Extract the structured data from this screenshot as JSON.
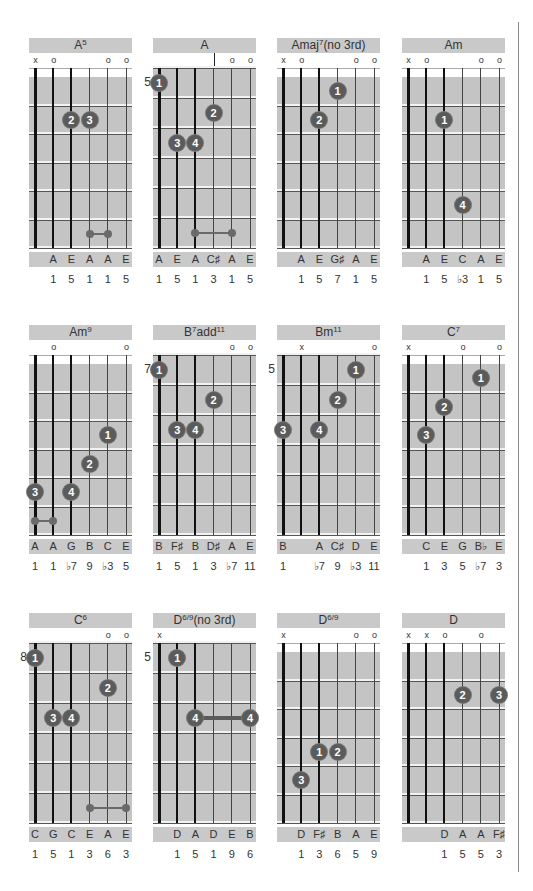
{
  "layout": {
    "columns_x": [
      29,
      153,
      277,
      402
    ],
    "rows_y": [
      38,
      325,
      613
    ]
  },
  "chords": [
    {
      "name": "A",
      "sup": "5",
      "suffix": "",
      "markers": [
        "x",
        "o",
        "",
        "",
        "o",
        "o"
      ],
      "fret_label": "",
      "open": true,
      "dots": [
        {
          "string": 3,
          "fret": 2,
          "label": "2"
        },
        {
          "string": 4,
          "fret": 2,
          "label": "3"
        }
      ],
      "barres": [
        {
          "type": "mini",
          "from": 4,
          "to": 5,
          "fret": 6
        }
      ],
      "notes": [
        "",
        "A",
        "E",
        "A",
        "A",
        "E"
      ],
      "intervals": [
        "",
        "1",
        "5",
        "1",
        "1",
        "5"
      ]
    },
    {
      "name": "A",
      "sup": "",
      "suffix": "",
      "markers": [
        "",
        "",
        "",
        "|",
        "o",
        "o"
      ],
      "fret_label": "5",
      "open": false,
      "dots": [
        {
          "string": 1,
          "fret": 1,
          "label": "1"
        },
        {
          "string": 4,
          "fret": 2,
          "label": "2"
        },
        {
          "string": 2,
          "fret": 3,
          "label": "3"
        },
        {
          "string": 3,
          "fret": 3,
          "label": "4"
        }
      ],
      "barres": [
        {
          "type": "mini",
          "from": 3,
          "to": 5,
          "fret": 6
        }
      ],
      "notes": [
        "A",
        "E",
        "A",
        "C♯",
        "A",
        "E"
      ],
      "intervals": [
        "1",
        "5",
        "1",
        "3",
        "1",
        "5"
      ]
    },
    {
      "name": "Amaj",
      "sup": "7",
      "suffix": "(no 3rd)",
      "markers": [
        "x",
        "o",
        "",
        "",
        "o",
        "o"
      ],
      "fret_label": "",
      "open": true,
      "dots": [
        {
          "string": 4,
          "fret": 1,
          "label": "1"
        },
        {
          "string": 3,
          "fret": 2,
          "label": "2"
        }
      ],
      "barres": [],
      "notes": [
        "",
        "A",
        "E",
        "G♯",
        "A",
        "E"
      ],
      "intervals": [
        "",
        "1",
        "5",
        "7",
        "1",
        "5"
      ]
    },
    {
      "name": "Am",
      "sup": "",
      "suffix": "",
      "markers": [
        "x",
        "o",
        "",
        "",
        "o",
        "o"
      ],
      "fret_label": "",
      "open": true,
      "dots": [
        {
          "string": 3,
          "fret": 2,
          "label": "1"
        },
        {
          "string": 4,
          "fret": 5,
          "label": "4"
        }
      ],
      "barres": [],
      "notes": [
        "",
        "A",
        "E",
        "C",
        "A",
        "E"
      ],
      "intervals": [
        "",
        "1",
        "5",
        "♭3",
        "1",
        "5"
      ]
    },
    {
      "name": "Am",
      "sup": "9",
      "suffix": "",
      "markers": [
        "",
        "o",
        "",
        "",
        "",
        "o"
      ],
      "fret_label": "",
      "open": true,
      "dots": [
        {
          "string": 5,
          "fret": 3,
          "label": "1"
        },
        {
          "string": 4,
          "fret": 4,
          "label": "2"
        },
        {
          "string": 1,
          "fret": 5,
          "label": "3"
        },
        {
          "string": 3,
          "fret": 5,
          "label": "4"
        }
      ],
      "barres": [
        {
          "type": "mini",
          "from": 1,
          "to": 2,
          "fret": 6
        }
      ],
      "notes": [
        "A",
        "A",
        "G",
        "B",
        "C",
        "E"
      ],
      "intervals": [
        "1",
        "1",
        "♭7",
        "9",
        "♭3",
        "5"
      ]
    },
    {
      "name": "B",
      "sup": "7",
      "suffix": "add",
      "sup2": "11",
      "markers": [
        "",
        "",
        "",
        "",
        "o",
        "o"
      ],
      "fret_label": "7",
      "open": false,
      "dots": [
        {
          "string": 1,
          "fret": 1,
          "label": "1"
        },
        {
          "string": 4,
          "fret": 2,
          "label": "2"
        },
        {
          "string": 2,
          "fret": 3,
          "label": "3"
        },
        {
          "string": 3,
          "fret": 3,
          "label": "4"
        }
      ],
      "barres": [],
      "notes": [
        "B",
        "F♯",
        "B",
        "D♯",
        "A",
        "E"
      ],
      "intervals": [
        "1",
        "5",
        "1",
        "3",
        "♭7",
        "11"
      ]
    },
    {
      "name": "Bm",
      "sup": "11",
      "suffix": "",
      "markers": [
        "",
        "x",
        "",
        "",
        "",
        "o"
      ],
      "fret_label": "5",
      "open": false,
      "dots": [
        {
          "string": 5,
          "fret": 1,
          "label": "1"
        },
        {
          "string": 4,
          "fret": 2,
          "label": "2"
        },
        {
          "string": 1,
          "fret": 3,
          "label": "3"
        },
        {
          "string": 3,
          "fret": 3,
          "label": "4"
        }
      ],
      "barres": [],
      "notes": [
        "B",
        "",
        "A",
        "C♯",
        "D",
        "E"
      ],
      "intervals": [
        "1",
        "",
        "♭7",
        "9",
        "♭3",
        "11"
      ]
    },
    {
      "name": "C",
      "sup": "7",
      "suffix": "",
      "markers": [
        "x",
        "",
        "",
        "o",
        "",
        "o"
      ],
      "fret_label": "",
      "open": true,
      "dots": [
        {
          "string": 5,
          "fret": 1,
          "label": "1"
        },
        {
          "string": 3,
          "fret": 2,
          "label": "2"
        },
        {
          "string": 2,
          "fret": 3,
          "label": "3"
        }
      ],
      "barres": [],
      "notes": [
        "",
        "C",
        "E",
        "G",
        "B♭",
        "E"
      ],
      "intervals": [
        "",
        "1",
        "3",
        "5",
        "♭7",
        "3"
      ]
    },
    {
      "name": "C",
      "sup": "6",
      "suffix": "",
      "markers": [
        "",
        "",
        "",
        "",
        "o",
        "o"
      ],
      "fret_label": "8",
      "open": false,
      "dots": [
        {
          "string": 1,
          "fret": 1,
          "label": "1"
        },
        {
          "string": 5,
          "fret": 2,
          "label": "2"
        },
        {
          "string": 2,
          "fret": 3,
          "label": "3"
        },
        {
          "string": 3,
          "fret": 3,
          "label": "4"
        }
      ],
      "barres": [
        {
          "type": "mini",
          "from": 4,
          "to": 6,
          "fret": 6
        }
      ],
      "notes": [
        "C",
        "G",
        "C",
        "E",
        "A",
        "E"
      ],
      "intervals": [
        "1",
        "5",
        "1",
        "3",
        "6",
        "3"
      ]
    },
    {
      "name": "D",
      "sup": "6/9",
      "suffix": "(no 3rd)",
      "markers": [
        "x",
        "",
        "",
        "",
        "",
        ""
      ],
      "fret_label": "5",
      "open": false,
      "dots": [
        {
          "string": 2,
          "fret": 1,
          "label": "1"
        },
        {
          "string": 3,
          "fret": 3,
          "label": "4"
        },
        {
          "string": 6,
          "fret": 3,
          "label": "4"
        }
      ],
      "barres": [
        {
          "type": "thick",
          "from": 3,
          "to": 6,
          "fret": 3
        }
      ],
      "notes": [
        "",
        "D",
        "A",
        "D",
        "E",
        "B"
      ],
      "intervals": [
        "",
        "1",
        "5",
        "1",
        "9",
        "6"
      ]
    },
    {
      "name": "D",
      "sup": "6/9",
      "suffix": "",
      "markers": [
        "x",
        "",
        "",
        "",
        "o",
        "o"
      ],
      "fret_label": "",
      "open": true,
      "dots": [
        {
          "string": 3,
          "fret": 4,
          "label": "1"
        },
        {
          "string": 4,
          "fret": 4,
          "label": "2"
        },
        {
          "string": 2,
          "fret": 5,
          "label": "3"
        }
      ],
      "barres": [],
      "notes": [
        "",
        "D",
        "F♯",
        "B",
        "A",
        "E"
      ],
      "intervals": [
        "",
        "1",
        "3",
        "6",
        "5",
        "9"
      ]
    },
    {
      "name": "D",
      "sup": "",
      "suffix": "",
      "markers": [
        "x",
        "x",
        "o",
        "",
        "o",
        ""
      ],
      "fret_label": "",
      "open": true,
      "dots": [
        {
          "string": 4,
          "fret": 2,
          "label": "2"
        },
        {
          "string": 6,
          "fret": 2,
          "label": "3"
        }
      ],
      "barres": [],
      "notes": [
        "",
        "",
        "D",
        "A",
        "A",
        "F♯"
      ],
      "intervals": [
        "",
        "",
        "1",
        "5",
        "5",
        "3"
      ]
    }
  ]
}
